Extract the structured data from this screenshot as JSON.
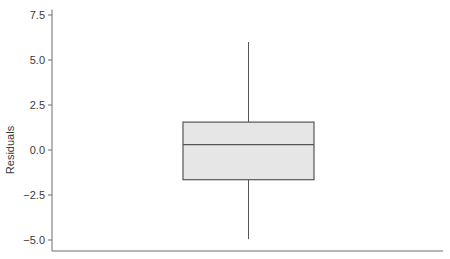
{
  "chart_data": {
    "type": "box",
    "title": "",
    "xlabel": "",
    "ylabel": "Residuals",
    "ylim": [
      -5.6,
      7.8
    ],
    "yticks": [
      7.5,
      5.0,
      2.5,
      0.0,
      -2.5,
      -5.0
    ],
    "ytick_labels": [
      "7.5",
      "5.0",
      "2.5",
      "0.0",
      "−2.5",
      "−5.0"
    ],
    "grid": false,
    "legend": "none",
    "boxes": [
      {
        "name": "Residuals",
        "whisker_high": 6.0,
        "q3": 1.55,
        "median": 0.3,
        "q1": -1.65,
        "whisker_low": -4.95
      }
    ],
    "colors": {
      "box_fill": "#e6e6e6",
      "box_stroke": "#555555",
      "axis": "#6e6e6e"
    }
  }
}
